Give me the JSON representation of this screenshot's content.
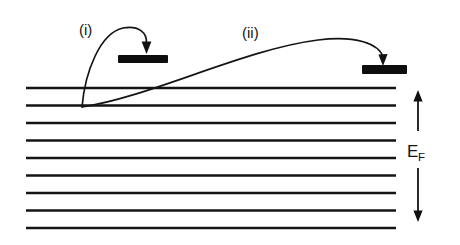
{
  "figure": {
    "kind": "energy-level-diagram",
    "background_color": "#ffffff",
    "ink_color": "#141414",
    "width": 460,
    "height": 245
  },
  "labels": {
    "process_one": "(i)",
    "process_two": "(ii)",
    "fermi_symbol_base": "E",
    "fermi_symbol_subscript": "F"
  },
  "energy_levels": {
    "count": 9,
    "x_start": 26,
    "x_end": 396,
    "y_positions": [
      88,
      105.5,
      123,
      140.5,
      158,
      175.5,
      193,
      210.5,
      228
    ],
    "stroke_color": "#141414",
    "stroke_width": 2.6
  },
  "adsorbate_states": [
    {
      "name": "left-state-bar",
      "x": 118,
      "y": 55,
      "width": 50,
      "height": 8,
      "fill": "#0d0d0d"
    },
    {
      "name": "right-state-bar",
      "x": 362,
      "y": 65,
      "width": 45,
      "height": 9,
      "fill": "#0d0d0d"
    }
  ],
  "trajectories": [
    {
      "name": "transition-i",
      "label": "(i)",
      "path": "M 82,107 C 86,70 100,34 124,29 C 140,26 146,34 146,44",
      "origin": [
        82,
        107
      ],
      "terminus": [
        146,
        48
      ],
      "arrow_at": "left-state-bar"
    },
    {
      "name": "transition-ii",
      "label": "(ii)",
      "path": "M 82,107 C 150,96 250,48 320,40 C 358,36 378,46 382,58",
      "origin": [
        82,
        107
      ],
      "terminus": [
        382,
        62
      ],
      "arrow_at": "right-state-bar"
    }
  ],
  "fermi_indicator": {
    "label_base": "E",
    "label_subscript": "F",
    "up_arrow": {
      "x": 418,
      "y_top": 92,
      "y_bottom": 130
    },
    "down_arrow": {
      "x": 418,
      "y_top": 168,
      "y_bottom": 222
    },
    "label_position": [
      408,
      160
    ]
  }
}
